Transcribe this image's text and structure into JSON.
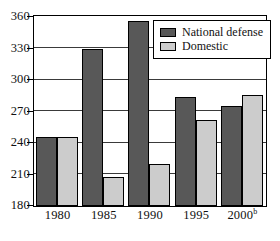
{
  "chart_data": {
    "type": "bar",
    "title": "",
    "subtitle": "",
    "xlabel": "",
    "ylabel": "",
    "categories": [
      "1980",
      "1985",
      "1990",
      "1995",
      "2000"
    ],
    "category_superscripts": [
      "",
      "",
      "",
      "",
      "b"
    ],
    "series": [
      {
        "name": "National defense",
        "color": "#585858",
        "values": [
          246,
          330,
          356,
          284,
          275
        ]
      },
      {
        "name": "Domestic",
        "color": "#cccccc",
        "values": [
          246,
          208,
          220,
          262,
          286
        ]
      }
    ],
    "ylim": [
      180,
      360
    ],
    "yticks": [
      180,
      210,
      240,
      270,
      300,
      330,
      360
    ],
    "ytick_labels": [
      "180",
      "210",
      "240",
      "270",
      "300",
      "330",
      "360"
    ],
    "grid": true,
    "legend_position": "top-right",
    "legend_entries": [
      "National defense",
      "Domestic"
    ]
  }
}
